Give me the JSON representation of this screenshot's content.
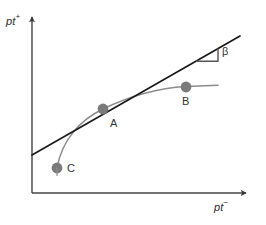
{
  "figure": {
    "background_color": "#ffffff",
    "axes": {
      "y_label": "pt",
      "y_superscript": "+",
      "x_label": "pt",
      "x_superscript": "−",
      "axis_color": "#444444",
      "origin": {
        "x": 32,
        "y": 193
      },
      "y_axis_top": {
        "x": 32,
        "y": 15
      },
      "x_axis_right": {
        "x": 248,
        "y": 193
      }
    },
    "tangent_line": {
      "color": "#1a1a1a",
      "start": {
        "x": 32,
        "y": 155
      },
      "end": {
        "x": 240,
        "y": 36
      },
      "angle_label": "β"
    },
    "angle_marker": {
      "label": "β",
      "apex": {
        "x": 196,
        "y": 61
      },
      "corner": {
        "x": 218,
        "y": 61
      },
      "top": {
        "x": 218,
        "y": 48
      },
      "color": "#555555"
    },
    "curve": {
      "color": "#8c8c8c",
      "path": "M 57 168 C 62 140 80 120 103 109 C 130 96 160 88 186 86.5 C 198 86 210 85.5 218 85.3"
    },
    "points": [
      {
        "name": "A",
        "label": "A",
        "x": 103,
        "y": 109,
        "color": "#7a7a7a",
        "radius": 5.5
      },
      {
        "name": "B",
        "label": "B",
        "x": 186,
        "y": 87,
        "color": "#7a7a7a",
        "radius": 5.5
      },
      {
        "name": "C",
        "label": "C",
        "x": 57,
        "y": 168,
        "color": "#7a7a7a",
        "radius": 5.5
      }
    ]
  }
}
